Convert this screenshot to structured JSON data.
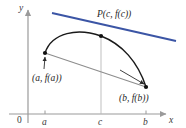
{
  "figure": {
    "background_color": "#ffffff",
    "width": 186,
    "height": 128
  },
  "axes": {
    "y_axis_label": "y",
    "x_axis_label": "x",
    "origin_label": "0",
    "axis_color": "#9a9a9a",
    "x_axis_y": 114,
    "y_axis_x": 28,
    "ticks": [
      {
        "label": "a",
        "x": 45
      },
      {
        "label": "c",
        "x": 101
      },
      {
        "label": "b",
        "x": 146
      }
    ]
  },
  "curve": {
    "color": "#1a1a1a",
    "description": "arc of f from (a, f(a)) rising to maximum then falling to (b, f(b))"
  },
  "tangent_line": {
    "color": "#3b55a5",
    "description": "tangent to the curve at P",
    "x1": 52,
    "y1": 13,
    "x2": 176,
    "y2": 41
  },
  "secant_line": {
    "color": "#8a8a8a",
    "description": "secant line joining (a, f(a)) and (b, f(b))",
    "x1": 45,
    "y1": 53,
    "x2": 146,
    "y2": 87
  },
  "vertical_line_at_c": {
    "color": "#b5b5b5",
    "x": 101,
    "y_top": 36,
    "y_bottom": 114
  },
  "points": [
    {
      "name": "point-a",
      "label": "(a, f(a))",
      "x": 45,
      "y": 53,
      "label_x": 38,
      "label_y": 78
    },
    {
      "name": "point-c",
      "label": "P(c, f(c))",
      "x": 101,
      "y": 36,
      "label_x": 97,
      "label_y": 17
    },
    {
      "name": "point-b",
      "label": "(b, f(b))",
      "x": 146,
      "y": 87,
      "label_x": 120,
      "label_y": 101
    }
  ],
  "annotation_arrows": [
    {
      "name": "arrow-to-point-a",
      "x1": 44,
      "y1": 68,
      "x2": 45,
      "y2": 56
    },
    {
      "name": "arrow-to-point-b",
      "x1": 122,
      "y1": 72,
      "x2": 144,
      "y2": 85
    }
  ]
}
